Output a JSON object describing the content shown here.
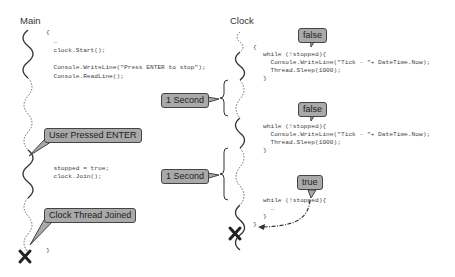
{
  "columns": {
    "main": {
      "title": "Main"
    },
    "clock": {
      "title": "Clock"
    }
  },
  "main_code": {
    "block1": [
      "{",
      "  …",
      "  clock.Start();",
      "",
      "  Console.WriteLine(\"Press ENTER to stop\");",
      "  Console.ReadLine();"
    ],
    "block2": [
      "  stopped = true;",
      "  clock.Join();"
    ],
    "close": "}"
  },
  "clock_code": {
    "open": "{",
    "loop1": [
      "while (!stopped){",
      "  Console.WriteLine(\"Tick - \"+ DateTime.Now);",
      "  Thread.Sleep(1000);",
      "}"
    ],
    "loop2": [
      "while (!stopped){",
      "  Console.WriteLine(\"Tick - \"+ DateTime.Now);",
      "  Thread.Sleep(1000);",
      "}"
    ],
    "loop3": [
      "while (!stopped){",
      "  …",
      "}"
    ],
    "close": "}"
  },
  "callouts": {
    "user_pressed_enter": "User Pressed ENTER",
    "clock_thread_joined": "Clock Thread Joined",
    "one_second_1": "1 Second",
    "one_second_2": "1 Second",
    "false_1": "false",
    "false_2": "false",
    "true_1": "true"
  },
  "markers": {
    "main_end": "X",
    "clock_end": "X"
  },
  "colors": {
    "callout_fill": "#a9a9a9",
    "callout_border": "#444444",
    "line": "#333333"
  }
}
